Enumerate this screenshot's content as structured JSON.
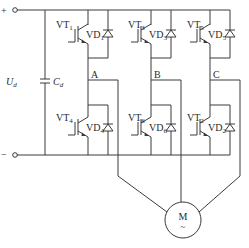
{
  "diagram": {
    "type": "three-phase inverter driving motor",
    "supply": {
      "positive_label": "+",
      "negative_label": "−",
      "voltage_label": "U",
      "voltage_sub": "d",
      "capacitor_label": "C",
      "capacitor_sub": "d"
    },
    "legs": [
      {
        "phase": "A",
        "upper": {
          "transistor": "VT",
          "t_sub": "1",
          "diode": "VD",
          "d_sub": "1"
        },
        "lower": {
          "transistor": "VT",
          "t_sub": "4",
          "diode": "VD",
          "d_sub": "4"
        }
      },
      {
        "phase": "B",
        "upper": {
          "transistor": "VT",
          "t_sub": "3",
          "diode": "VD",
          "d_sub": "3"
        },
        "lower": {
          "transistor": "VT",
          "t_sub": "6",
          "diode": "VD",
          "d_sub": "6"
        }
      },
      {
        "phase": "C",
        "upper": {
          "transistor": "VT",
          "t_sub": "5",
          "diode": "VD",
          "d_sub": "5"
        },
        "lower": {
          "transistor": "VT",
          "t_sub": "2",
          "diode": "VD",
          "d_sub": "2"
        }
      }
    ],
    "motor": {
      "label": "M",
      "symbol": "~"
    }
  }
}
